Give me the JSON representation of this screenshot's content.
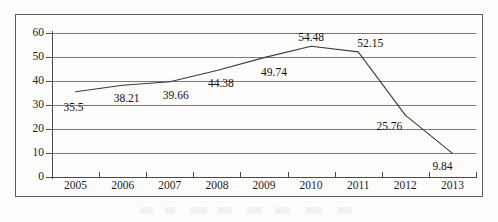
{
  "chart_data": {
    "type": "line",
    "title": "",
    "subtitle": "",
    "xlabel": "",
    "ylabel": "",
    "categories": [
      "2005",
      "2006",
      "2007",
      "2008",
      "2009",
      "2010",
      "2011",
      "2012",
      "2013"
    ],
    "series": [
      {
        "name": "",
        "values": [
          35.5,
          38.21,
          39.66,
          44.38,
          49.74,
          54.48,
          52.15,
          25.76,
          9.84
        ]
      }
    ],
    "point_labels": [
      "35.5",
      "38.21",
      "39.66",
      "44.38",
      "49.74",
      "54.48",
      "52.15",
      "25.76",
      "9.84"
    ],
    "ylim": [
      0,
      60
    ],
    "y_ticks": [
      0,
      10,
      20,
      30,
      40,
      50,
      60
    ],
    "y_tick_labels": [
      "0",
      "10",
      "20",
      "30",
      "40",
      "50",
      "60"
    ],
    "grid": true,
    "grid_axis": "y",
    "legend": false,
    "legend_position": "none",
    "line_color": "#3b3b3b",
    "grid_color": "#7a7a7a",
    "axis_color": "#4a4a4a",
    "text_color": "#1c1c1c",
    "background_color": "#fdfdfc",
    "frame_color": "#5d5d5d",
    "markers": false
  }
}
